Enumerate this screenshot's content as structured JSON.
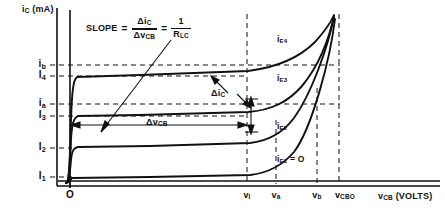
{
  "figure": {
    "name": "collector-characteristics-common-base",
    "background": "#ffffff",
    "ink": "#111111"
  },
  "axes": {
    "y_title": "i_C (mA)",
    "y_title_parts": {
      "i": "i",
      "C": "C",
      "unit": "(mA)"
    },
    "x_title": "v_CB (VOLTS)",
    "x_title_parts": {
      "v": "v",
      "CB": "CB",
      "unit": "(VOLTS)"
    },
    "origin_label": "O"
  },
  "y_ticks": [
    {
      "id": "i-b",
      "base": "i",
      "sub": "b",
      "value_px": 65,
      "dashed": true
    },
    {
      "id": "I-4",
      "base": "I",
      "sub": "4",
      "value_px": 76,
      "dashed": true
    },
    {
      "id": "i-a",
      "base": "i",
      "sub": "a",
      "value_px": 104,
      "dashed": true
    },
    {
      "id": "I-3",
      "base": "I",
      "sub": "3",
      "value_px": 116,
      "dashed": true
    },
    {
      "id": "I-2",
      "base": "I",
      "sub": "2",
      "value_px": 148,
      "dashed": true
    },
    {
      "id": "I-1",
      "base": "I",
      "sub": "1",
      "value_px": 177,
      "dashed": true
    }
  ],
  "x_ticks": [
    {
      "id": "v-1",
      "base": "v",
      "sub": "I",
      "value_px": 247,
      "dashed": true
    },
    {
      "id": "v-a",
      "base": "v",
      "sub": "a",
      "value_px": 276,
      "dashed": true
    },
    {
      "id": "v-b",
      "base": "v",
      "sub": "b",
      "value_px": 317,
      "dashed": true
    },
    {
      "id": "v-cbo",
      "base": "v",
      "sub": "CBO",
      "value_px": 339,
      "dashed": true
    }
  ],
  "curves": [
    {
      "id": "i-E4",
      "base": "i",
      "sub": "E4",
      "suffix": "",
      "label_x": 277,
      "label_y": 39
    },
    {
      "id": "i-E3",
      "base": "i",
      "sub": "E3",
      "suffix": "",
      "label_x": 277,
      "label_y": 78
    },
    {
      "id": "i-E2",
      "base": "i",
      "sub": "E2",
      "suffix": "",
      "label_x": 277,
      "label_y": 126
    },
    {
      "id": "i-E1",
      "base": "i",
      "sub": "E1",
      "suffix": " = O",
      "label_x": 277,
      "label_y": 159
    }
  ],
  "annotations": {
    "slope": {
      "word": "SLOPE",
      "equals_1": "=",
      "numerator": {
        "base": "Δi",
        "sub": "C"
      },
      "denominator": {
        "base": "Δv",
        "sub": "CB"
      },
      "equals_2": "=",
      "rhs_numerator": "1",
      "rhs_denominator": {
        "base": "R",
        "sub": "LC"
      }
    },
    "delta_ic": {
      "base": "Δi",
      "sub": "C"
    },
    "delta_vcb": {
      "base": "Δv",
      "sub": "CB"
    }
  }
}
